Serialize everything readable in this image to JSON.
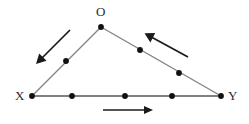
{
  "figure": {
    "type": "geometry-diagram",
    "width": 249,
    "height": 124,
    "background_color": "#ffffff",
    "line_color": "#808080",
    "point_color": "#111111",
    "arrow_color": "#1a1a1a",
    "label_color": "#2b2b2b"
  },
  "vertices": [
    {
      "id": "O",
      "label": "O",
      "x": 101,
      "y": 27,
      "label_x": 96,
      "label_y": 5
    },
    {
      "id": "X",
      "label": "X",
      "x": 32,
      "y": 96,
      "label_x": 15,
      "label_y": 89
    },
    {
      "id": "Y",
      "label": "Y",
      "x": 221,
      "y": 96,
      "label_x": 228,
      "label_y": 89
    }
  ],
  "edges": [
    {
      "id": "OX",
      "from": "O",
      "to": "X",
      "x1": 101,
      "y1": 27,
      "x2": 32,
      "y2": 96
    },
    {
      "id": "OY",
      "from": "O",
      "to": "Y",
      "x1": 101,
      "y1": 27,
      "x2": 221,
      "y2": 96
    },
    {
      "id": "XY",
      "from": "X",
      "to": "Y",
      "x1": 32,
      "y1": 96,
      "x2": 221,
      "y2": 96
    }
  ],
  "points": [
    {
      "id": "point-O",
      "on_edge": "vertex",
      "x": 101,
      "y": 27,
      "r": 2.8
    },
    {
      "id": "point-X",
      "on_edge": "vertex",
      "x": 32,
      "y": 96,
      "r": 2.8
    },
    {
      "id": "point-Y",
      "on_edge": "vertex",
      "x": 221,
      "y": 96,
      "r": 2.8
    },
    {
      "id": "point-OX-1",
      "on_edge": "OX",
      "x": 66,
      "y": 61,
      "r": 2.8
    },
    {
      "id": "point-OY-1",
      "on_edge": "OY",
      "x": 140,
      "y": 50,
      "r": 2.8
    },
    {
      "id": "point-OY-2",
      "on_edge": "OY",
      "x": 179,
      "y": 73,
      "r": 2.8
    },
    {
      "id": "point-XY-1",
      "on_edge": "XY",
      "x": 72,
      "y": 96,
      "r": 2.8
    },
    {
      "id": "point-XY-2",
      "on_edge": "XY",
      "x": 125,
      "y": 96,
      "r": 2.8
    },
    {
      "id": "point-XY-3",
      "on_edge": "XY",
      "x": 172,
      "y": 96,
      "r": 2.8
    }
  ],
  "arrows": [
    {
      "id": "arrow-left",
      "describes_edge": "OX",
      "direction": "down-left",
      "x1": 70,
      "y1": 30,
      "x2": 38,
      "y2": 62
    },
    {
      "id": "arrow-right",
      "describes_edge": "OY",
      "direction": "up-left",
      "x1": 188,
      "y1": 57,
      "x2": 146,
      "y2": 34
    },
    {
      "id": "arrow-bottom",
      "describes_edge": "XY",
      "direction": "right",
      "x1": 103,
      "y1": 110,
      "x2": 152,
      "y2": 110
    }
  ]
}
